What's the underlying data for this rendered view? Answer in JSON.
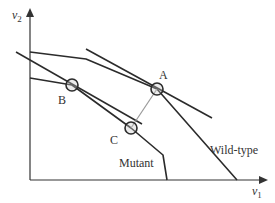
{
  "axes": {
    "x_label": "v",
    "x_sub": "1",
    "y_label": "v",
    "y_sub": "2"
  },
  "curves": [
    {
      "name": "Wild-type",
      "label": "Wild-type"
    },
    {
      "name": "Mutant",
      "label": "Mutant"
    }
  ],
  "points": [
    {
      "id": "A",
      "label": "A"
    },
    {
      "id": "B",
      "label": "B"
    },
    {
      "id": "C",
      "label": "C"
    }
  ],
  "colors": {
    "lines": "#2b2b2b",
    "connector": "#9a9a9a"
  }
}
